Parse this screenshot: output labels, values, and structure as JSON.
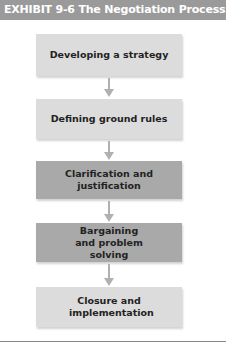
{
  "header": {
    "title": "EXHIBIT 9-6  The Negotiation Process"
  },
  "steps": [
    {
      "label": "Developing a strategy",
      "shade": "light"
    },
    {
      "label": "Defining ground rules",
      "shade": "light"
    },
    {
      "label": "Clarification and justification",
      "shade": "dark"
    },
    {
      "label": "Bargaining and problem solving",
      "shade": "dark"
    },
    {
      "label": "Closure and implementation",
      "shade": "light"
    }
  ],
  "colors": {
    "header_bg": "#9a9a9a",
    "light_box": "#dcdcdc",
    "dark_box": "#a9a9a9",
    "arrow": "#b0b0b0"
  }
}
